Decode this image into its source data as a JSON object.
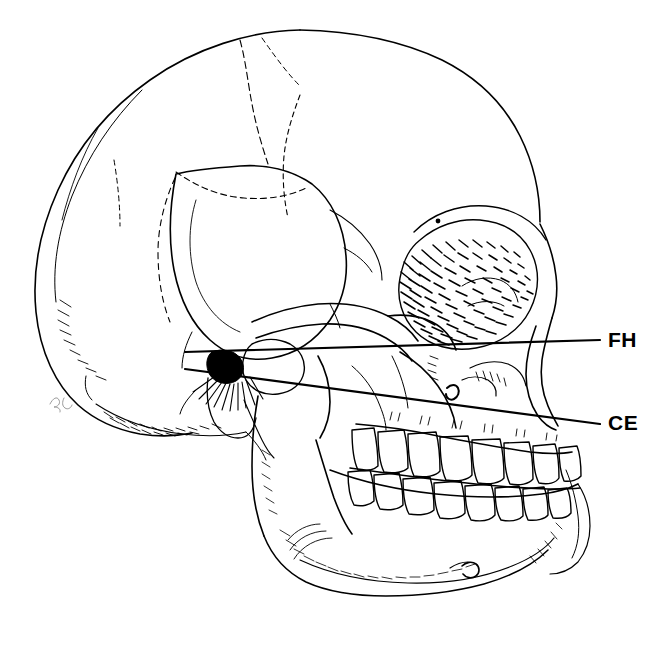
{
  "figure": {
    "background_color": "#ffffff",
    "ink_color": "#000000",
    "width": 657,
    "height": 647
  },
  "annotations": {
    "lines": [
      {
        "id": "FH",
        "label": "FH",
        "name": "Frankfort Horizontal plane",
        "color": "#000000",
        "stroke_width": 2,
        "x1": 185,
        "y1": 352,
        "x2": 600,
        "y2": 340
      },
      {
        "id": "CE",
        "label": "CE",
        "name": "Condyle-to-eye reference plane",
        "color": "#000000",
        "stroke_width": 2,
        "x1": 185,
        "y1": 369,
        "x2": 600,
        "y2": 424
      }
    ],
    "labels": [
      {
        "id": "FH",
        "text": "FH",
        "x": 608,
        "y": 329
      },
      {
        "id": "CE",
        "text": "CE",
        "x": 608,
        "y": 412
      }
    ]
  },
  "landmarks": {
    "porion": {
      "label": "porion",
      "x": 225,
      "y": 366,
      "filled": true
    },
    "mental_foramen": {
      "label": "mental-foramen",
      "x": 470,
      "y": 570
    },
    "signature_mark": {
      "label": "artist-mark",
      "x": 57,
      "y": 400
    }
  },
  "icons": {
    "skull": "skull-lateral-icon",
    "fh_line": "reference-line-icon",
    "ce_line": "reference-line-icon"
  }
}
